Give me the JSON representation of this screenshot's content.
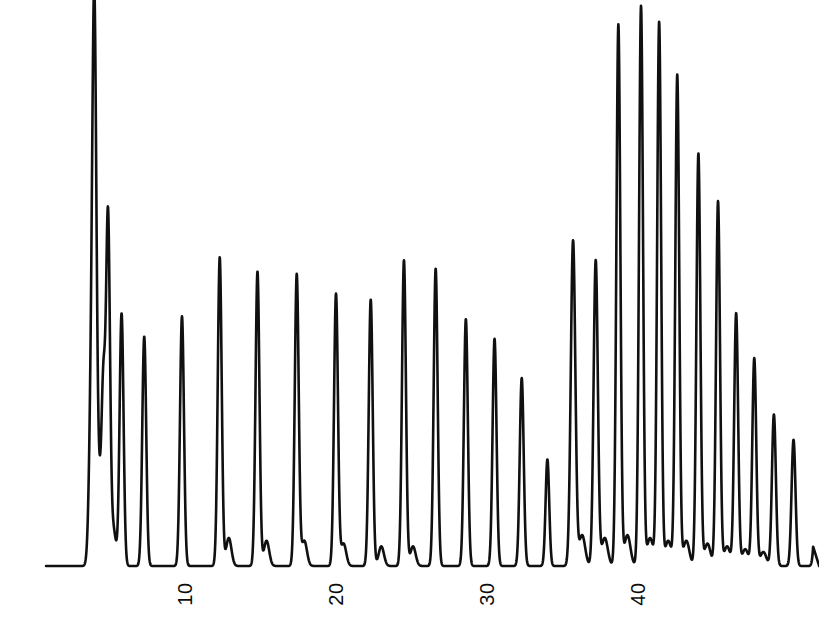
{
  "figure": {
    "title": "",
    "width": 819,
    "height": 623,
    "background_color": "#ffffff",
    "trace_color": "#101010"
  },
  "axis": {
    "label_orientation": "rotated-90-ccw",
    "tick_labels": [
      "10",
      "20",
      "30",
      "40"
    ],
    "tick_values": [
      10,
      20,
      30,
      40
    ],
    "tick_pixel_x": [
      185,
      336,
      487,
      638
    ],
    "baseline_pixel_y": 566,
    "x_pixel_per_unit": 15.1,
    "x_origin_pixel": 34
  },
  "chart_data": {
    "type": "line",
    "title": "",
    "subtitle": "",
    "xlabel": "",
    "ylabel": "",
    "xlim": [
      0,
      52
    ],
    "ylim": [
      0,
      100
    ],
    "grid": false,
    "legend": null,
    "annotations": [],
    "axis_ticks": {
      "x": [
        10,
        20,
        30,
        40
      ],
      "x_labels": [
        "10",
        "20",
        "30",
        "40"
      ],
      "y": [],
      "y_labels": []
    },
    "series": [
      {
        "name": "detector-signal",
        "peaks": [
          {
            "x": 3.8,
            "height": 28.3,
            "width": 0.3
          },
          {
            "x": 4.0,
            "height": 82.8,
            "width": 0.26
          },
          {
            "x": 4.6,
            "height": 27.6,
            "width": 0.24
          },
          {
            "x": 4.9,
            "height": 61.7,
            "width": 0.26
          },
          {
            "x": 5.8,
            "height": 45.0,
            "width": 0.26
          },
          {
            "x": 7.3,
            "height": 40.9,
            "width": 0.26
          },
          {
            "x": 9.8,
            "height": 44.5,
            "width": 0.26
          },
          {
            "x": 12.3,
            "height": 55.0,
            "width": 0.26
          },
          {
            "x": 14.8,
            "height": 52.5,
            "width": 0.26
          },
          {
            "x": 17.4,
            "height": 52.0,
            "width": 0.26
          },
          {
            "x": 20.0,
            "height": 48.5,
            "width": 0.26
          },
          {
            "x": 22.3,
            "height": 47.5,
            "width": 0.26
          },
          {
            "x": 24.5,
            "height": 54.5,
            "width": 0.26
          },
          {
            "x": 26.6,
            "height": 53.0,
            "width": 0.26
          },
          {
            "x": 28.6,
            "height": 44.0,
            "width": 0.26
          },
          {
            "x": 30.5,
            "height": 40.5,
            "width": 0.26
          },
          {
            "x": 32.3,
            "height": 33.5,
            "width": 0.26
          },
          {
            "x": 34.0,
            "height": 19.0,
            "width": 0.24
          },
          {
            "x": 35.7,
            "height": 58.0,
            "width": 0.3
          },
          {
            "x": 37.2,
            "height": 54.5,
            "width": 0.28
          },
          {
            "x": 38.7,
            "height": 96.5,
            "width": 0.26
          },
          {
            "x": 40.2,
            "height": 99.8,
            "width": 0.26
          },
          {
            "x": 41.4,
            "height": 96.9,
            "width": 0.26
          },
          {
            "x": 42.6,
            "height": 87.5,
            "width": 0.26
          },
          {
            "x": 44.0,
            "height": 73.5,
            "width": 0.26
          },
          {
            "x": 45.3,
            "height": 65.0,
            "width": 0.26
          },
          {
            "x": 46.5,
            "height": 45.0,
            "width": 0.26
          },
          {
            "x": 47.7,
            "height": 37.0,
            "width": 0.26
          },
          {
            "x": 49.0,
            "height": 27.0,
            "width": 0.26
          },
          {
            "x": 50.3,
            "height": 22.5,
            "width": 0.26
          },
          {
            "x": 51.8,
            "height": 11.5,
            "width": 0.26
          }
        ],
        "baseline_bumps": [
          {
            "x": 4.25,
            "height": 16.0,
            "width": 0.45
          },
          {
            "x": 5.25,
            "height": 6.5,
            "width": 0.35
          },
          {
            "x": 12.9,
            "height": 5.0,
            "width": 0.35
          },
          {
            "x": 15.4,
            "height": 4.5,
            "width": 0.35
          },
          {
            "x": 17.9,
            "height": 4.5,
            "width": 0.35
          },
          {
            "x": 20.5,
            "height": 4.0,
            "width": 0.35
          },
          {
            "x": 23.0,
            "height": 3.5,
            "width": 0.35
          },
          {
            "x": 25.1,
            "height": 3.5,
            "width": 0.35
          },
          {
            "x": 36.3,
            "height": 5.5,
            "width": 0.4
          },
          {
            "x": 37.8,
            "height": 5.0,
            "width": 0.4
          },
          {
            "x": 39.3,
            "height": 5.5,
            "width": 0.4
          },
          {
            "x": 40.8,
            "height": 5.0,
            "width": 0.4
          },
          {
            "x": 42.0,
            "height": 4.5,
            "width": 0.4
          },
          {
            "x": 43.2,
            "height": 4.5,
            "width": 0.4
          },
          {
            "x": 44.6,
            "height": 4.0,
            "width": 0.4
          },
          {
            "x": 45.9,
            "height": 3.5,
            "width": 0.4
          },
          {
            "x": 47.1,
            "height": 3.0,
            "width": 0.4
          },
          {
            "x": 48.3,
            "height": 2.5,
            "width": 0.4
          }
        ],
        "trace_start_x": 1.45,
        "trace_end_x": 51.6
      }
    ]
  }
}
